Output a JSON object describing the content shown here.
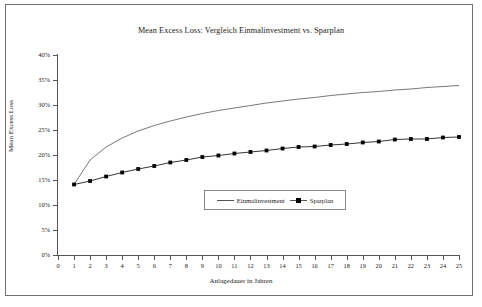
{
  "figure": {
    "title": "Mean Excess Loss: Vergleich Einmalinvestment vs. Sparplan",
    "border_color": "#6f6f6f",
    "background": "#ffffff"
  },
  "chart_data": {
    "type": "line",
    "title": "Mean Excess Loss: Vergleich Einmalinvestment vs. Sparplan",
    "xlabel": "Anlagedauer in Jahren",
    "ylabel": "Mean Excess Loss",
    "xlim": [
      0,
      25
    ],
    "ylim": [
      0,
      40
    ],
    "xticks": [
      0,
      1,
      2,
      3,
      4,
      5,
      6,
      7,
      8,
      9,
      10,
      11,
      12,
      13,
      14,
      15,
      16,
      17,
      18,
      19,
      20,
      21,
      22,
      23,
      24,
      25
    ],
    "xtick_labels": [
      "0",
      "1",
      "2",
      "3",
      "4",
      "5",
      "6",
      "7",
      "8",
      "9",
      "10",
      "11",
      "12",
      "13",
      "14",
      "15",
      "16",
      "17",
      "18",
      "19",
      "20",
      "21",
      "22",
      "23",
      "24",
      "25"
    ],
    "yticks": [
      0,
      5,
      10,
      15,
      20,
      25,
      30,
      35,
      40
    ],
    "ytick_labels": [
      "0%",
      "5%",
      "10%",
      "15%",
      "20%",
      "25%",
      "30%",
      "35%",
      "40%"
    ],
    "grid": false,
    "legend_position": "lower center",
    "x": [
      1,
      2,
      3,
      4,
      5,
      6,
      7,
      8,
      9,
      10,
      11,
      12,
      13,
      14,
      15,
      16,
      17,
      18,
      19,
      20,
      21,
      22,
      23,
      24,
      25
    ],
    "series": [
      {
        "name": "Einmalinvestment",
        "marker": "none",
        "color": "#555555",
        "values": [
          14.1,
          19.0,
          21.6,
          23.4,
          24.8,
          25.9,
          26.8,
          27.6,
          28.3,
          28.9,
          29.4,
          29.9,
          30.4,
          30.8,
          31.2,
          31.5,
          31.9,
          32.2,
          32.5,
          32.7,
          33.0,
          33.2,
          33.5,
          33.7,
          33.9
        ]
      },
      {
        "name": "Sparplan",
        "marker": "square",
        "color": "#000000",
        "values": [
          14.1,
          14.8,
          15.7,
          16.5,
          17.2,
          17.8,
          18.5,
          19.0,
          19.6,
          19.9,
          20.3,
          20.6,
          20.9,
          21.3,
          21.6,
          21.7,
          22.0,
          22.2,
          22.5,
          22.7,
          23.1,
          23.2,
          23.2,
          23.5,
          23.6
        ]
      }
    ]
  },
  "legend": {
    "entries": [
      {
        "label": "Einmalinvestment",
        "marker": "none"
      },
      {
        "label": "Sparplan",
        "marker": "square"
      }
    ]
  }
}
